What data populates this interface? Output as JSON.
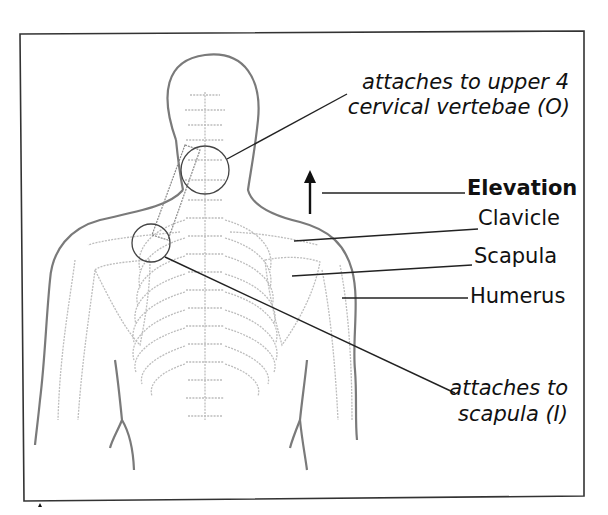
{
  "figure": {
    "type": "anatomical-diagram",
    "labels": {
      "origin": {
        "line1": "attaches to upper 4",
        "line2": "cervical vertebae (O)"
      },
      "action": "Elevation",
      "clavicle": "Clavicle",
      "scapula": "Scapula",
      "humerus": "Humerus",
      "insertion": {
        "line1": "attaches to",
        "line2": "scapula (I)"
      }
    },
    "colors": {
      "frame": "#333333",
      "outline": "#7a7a7a",
      "bone": "#bdbdbd",
      "leader": "#222222",
      "text": "#111111"
    }
  }
}
